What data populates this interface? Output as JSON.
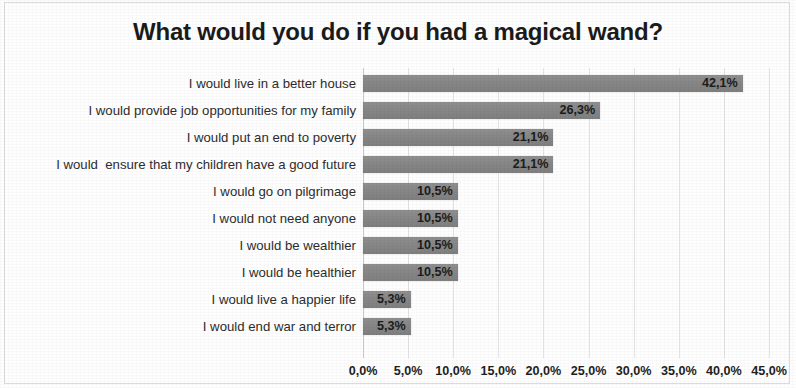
{
  "chart_data": {
    "type": "bar",
    "orientation": "horizontal",
    "title": "What would you do if you had a magical wand?",
    "xlabel": "",
    "ylabel": "",
    "xlim": [
      0,
      45
    ],
    "grid": true,
    "legend": false,
    "decimal_separator": ",",
    "unit": "%",
    "categories": [
      "I would live in a better house",
      "I would provide job opportunities for my family",
      "I would put an end to poverty",
      "I would  ensure that my children have a good future",
      "I would go on pilgrimage",
      "I would not need anyone",
      "I would be wealthier",
      "I would be healthier",
      "I would live a happier life",
      "I would end war and terror"
    ],
    "values": [
      42.1,
      26.3,
      21.1,
      21.1,
      10.5,
      10.5,
      10.5,
      10.5,
      5.3,
      5.3
    ],
    "value_labels": [
      "42,1%",
      "26,3%",
      "21,1%",
      "21,1%",
      "10,5%",
      "10,5%",
      "10,5%",
      "10,5%",
      "5,3%",
      "5,3%"
    ],
    "xticks": [
      0,
      5,
      10,
      15,
      20,
      25,
      30,
      35,
      40,
      45
    ],
    "xtick_labels": [
      "0,0%",
      "5,0%",
      "10,0%",
      "15,0%",
      "20,0%",
      "25,0%",
      "30,0%",
      "35,0%",
      "40,0%",
      "45,0%"
    ],
    "bar_color": "#878787",
    "gridline_color": "#e3e3e3",
    "text_color": "#231f20",
    "background_color": "#ffffff"
  }
}
